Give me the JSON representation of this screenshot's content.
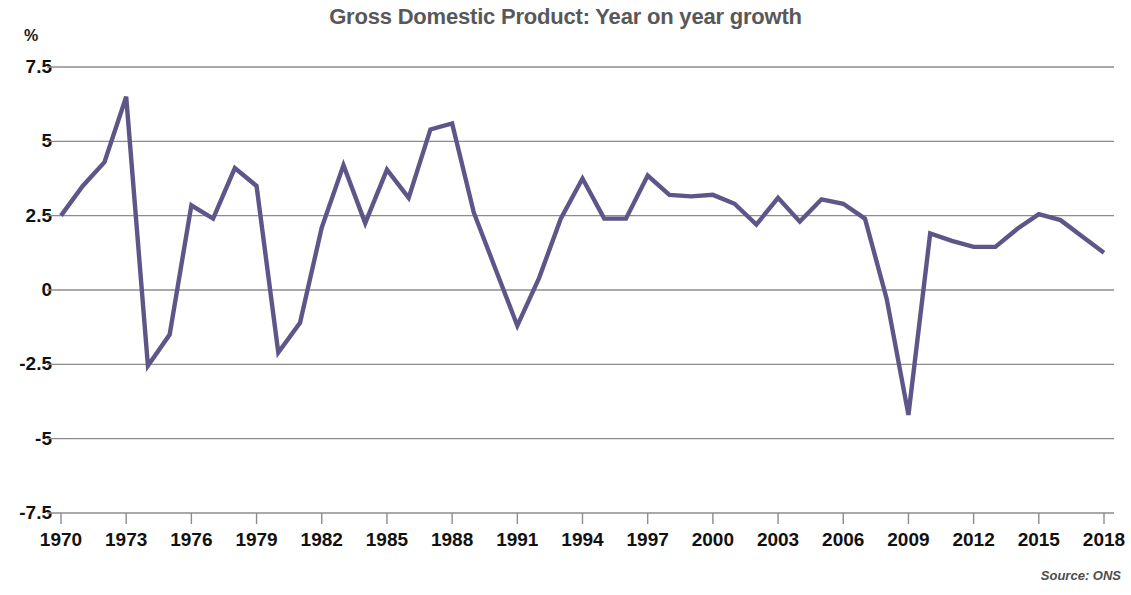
{
  "chart_data": {
    "type": "line",
    "title": "Gross Domestic Product: Year on year growth",
    "xlabel": "",
    "ylabel": "%",
    "unit_label": "%",
    "source": "Source: ONS",
    "grid": true,
    "legend": "none",
    "line_color": "#5e5688",
    "grid_color": "#8c8c8c",
    "axis_color": "#8c8c8c",
    "title_color": "#58585a",
    "ylim": [
      -7.5,
      7.5
    ],
    "yticks": [
      7.5,
      5,
      2.5,
      0,
      -2.5,
      -5,
      -7.5
    ],
    "ytick_labels": [
      "7.5",
      "5",
      "2.5",
      "0",
      "-2.5",
      "-5",
      "-7.5"
    ],
    "xlim": [
      1970,
      2018
    ],
    "xticks": [
      1970,
      1973,
      1976,
      1979,
      1982,
      1985,
      1988,
      1991,
      1994,
      1997,
      2000,
      2003,
      2006,
      2009,
      2012,
      2015,
      2018
    ],
    "xtick_labels": [
      "1970",
      "1973",
      "1976",
      "1979",
      "1982",
      "1985",
      "1988",
      "1991",
      "1994",
      "1997",
      "2000",
      "2003",
      "2006",
      "2009",
      "2012",
      "2015",
      "2018"
    ],
    "x": [
      1970,
      1971,
      1972,
      1973,
      1974,
      1975,
      1976,
      1977,
      1978,
      1979,
      1980,
      1981,
      1982,
      1983,
      1984,
      1985,
      1986,
      1987,
      1988,
      1989,
      1990,
      1991,
      1992,
      1993,
      1994,
      1995,
      1996,
      1997,
      1998,
      1999,
      2000,
      2001,
      2002,
      2003,
      2004,
      2005,
      2006,
      2007,
      2008,
      2009,
      2010,
      2011,
      2012,
      2013,
      2014,
      2015,
      2016,
      2017,
      2018
    ],
    "values": [
      2.5,
      3.5,
      4.3,
      6.5,
      -2.55,
      -1.5,
      2.85,
      2.4,
      4.1,
      3.5,
      -2.1,
      -1.1,
      2.1,
      4.2,
      2.25,
      4.05,
      3.1,
      5.4,
      5.6,
      2.6,
      0.7,
      -1.2,
      0.4,
      2.4,
      3.75,
      2.4,
      2.4,
      3.85,
      3.2,
      3.15,
      3.2,
      2.9,
      2.2,
      3.1,
      2.3,
      3.05,
      2.9,
      2.4,
      -0.3,
      -4.2,
      1.9,
      1.65,
      1.45,
      1.45,
      2.05,
      2.55,
      2.35,
      1.8,
      1.25
    ],
    "series": [
      {
        "name": "GDP year on year growth",
        "values": [
          2.5,
          3.5,
          4.3,
          6.5,
          -2.55,
          -1.5,
          2.85,
          2.4,
          4.1,
          3.5,
          -2.1,
          -1.1,
          2.1,
          4.2,
          2.25,
          4.05,
          3.1,
          5.4,
          5.6,
          2.6,
          0.7,
          -1.2,
          0.4,
          2.4,
          3.75,
          2.4,
          2.4,
          3.85,
          3.2,
          3.15,
          3.2,
          2.9,
          2.2,
          3.1,
          2.3,
          3.05,
          2.9,
          2.4,
          -0.3,
          -4.2,
          1.9,
          1.65,
          1.45,
          1.45,
          2.05,
          2.55,
          2.35,
          1.8,
          1.25
        ]
      }
    ]
  },
  "geometry": {
    "plot_left": 61,
    "plot_right": 1104,
    "y_top_value_px": 67,
    "y_bottom_value_px": 513
  }
}
